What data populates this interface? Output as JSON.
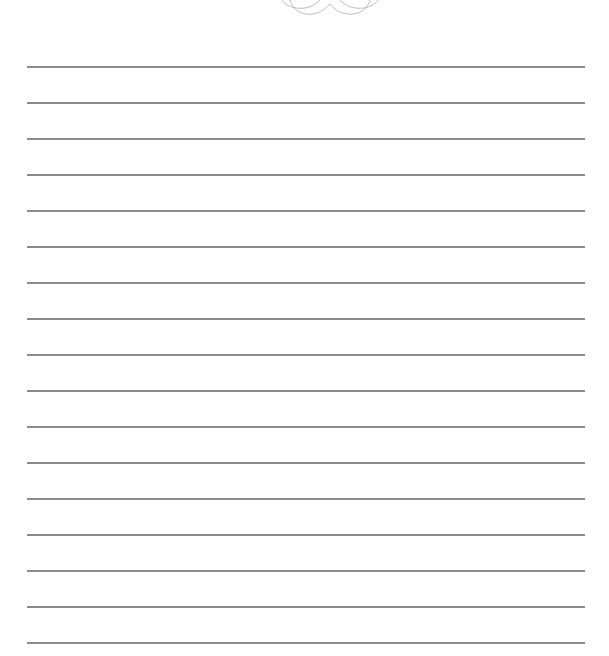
{
  "page": {
    "type": "lined-writing-paper",
    "ornament": "swirl-flourish",
    "line_color": "#8a8a8a",
    "line_count": 17,
    "line_start_y": 67,
    "line_spacing": 36
  }
}
